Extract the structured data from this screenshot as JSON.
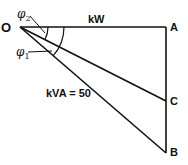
{
  "diagram": {
    "type": "power-triangle",
    "points": {
      "O": {
        "label": "O",
        "x": 20,
        "y": 27
      },
      "A": {
        "label": "A",
        "x": 166,
        "y": 27
      },
      "C": {
        "label": "C",
        "x": 166,
        "y": 101
      },
      "B": {
        "label": "B",
        "x": 166,
        "y": 153
      }
    },
    "labels": {
      "kw": "kW",
      "kva": "kVA = 50",
      "phi1_base": "φ",
      "phi1_sub": "1",
      "phi2_base": "φ",
      "phi2_sub": "2"
    },
    "colors": {
      "line": "#111111",
      "background": "#ffffff"
    }
  }
}
